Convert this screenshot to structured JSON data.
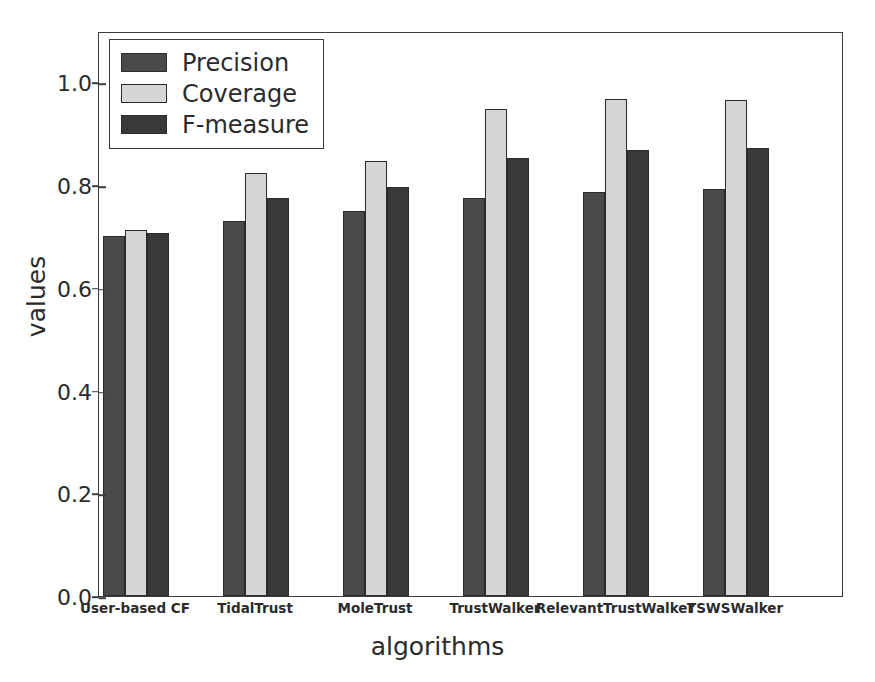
{
  "chart_data": {
    "type": "bar",
    "title": "",
    "xlabel": "algorithms",
    "ylabel": "values",
    "categories": [
      "User-based CF",
      "TidalTrust",
      "MoleTrust",
      "TrustWalker",
      "RelevantTrustWalker",
      "TSWSWalker"
    ],
    "series": [
      {
        "name": "Precision",
        "color": "#4a4a4a",
        "values": [
          0.7,
          0.73,
          0.75,
          0.775,
          0.787,
          0.793
        ]
      },
      {
        "name": "Coverage",
        "color": "#d6d6d6",
        "values": [
          0.712,
          0.824,
          0.847,
          0.948,
          0.967,
          0.966
        ]
      },
      {
        "name": "F-measure",
        "color": "#393939",
        "values": [
          0.706,
          0.775,
          0.796,
          0.853,
          0.869,
          0.873
        ]
      }
    ],
    "ylim": [
      0.0,
      1.1
    ],
    "yticks": [
      "0.0",
      "0.2",
      "0.4",
      "0.6",
      "0.8",
      "1.0"
    ],
    "ytick_values": [
      0.0,
      0.2,
      0.4,
      0.6,
      0.8,
      1.0
    ],
    "grid": false,
    "legend_position": "upper left",
    "legend_entries": [
      "Precision",
      "Coverage",
      "F-measure"
    ]
  }
}
